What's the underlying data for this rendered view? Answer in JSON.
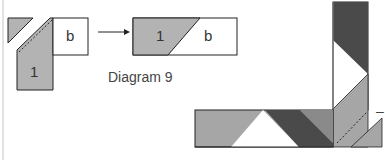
{
  "figure": {
    "caption": "Diagram 9",
    "colors": {
      "light_gray": "#b3b3b3",
      "mid_gray": "#a6a6a6",
      "dark_gray": "#4a4a4a",
      "outline": "#222222",
      "white": "#ffffff"
    },
    "step_before": {
      "piece_1_label": "1",
      "piece_b_label": "b"
    },
    "arrow": "right-arrow",
    "step_after": {
      "piece_1_label": "1",
      "piece_b_label": "b"
    },
    "side_mark": "–"
  }
}
